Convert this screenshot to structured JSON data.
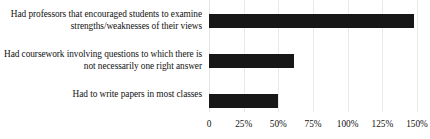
{
  "chart_data": {
    "type": "bar",
    "orientation": "horizontal",
    "title": "",
    "subtitle": "",
    "xlabel": "",
    "ylabel": "",
    "categories": [
      "Had professors that encouraged students to examine strengths/weaknesses of their views",
      "Had coursework involving questions to which there is not necessarily one right answer",
      "Had to write papers in most classes"
    ],
    "values": [
      148,
      61,
      50
    ],
    "xlim": [
      0,
      150
    ],
    "xticks": [
      0,
      25,
      50,
      75,
      100,
      125,
      150
    ],
    "xtick_labels": [
      "0",
      "25%",
      "50%",
      "75%",
      "100%",
      "125%",
      "150%"
    ],
    "grid": true,
    "legend": false,
    "bar_color": "#171717",
    "gridline_color": "#e9e9e9",
    "text_color": "#111111",
    "background_color": "#ffffff"
  },
  "axis": {
    "tick_labels": [
      "0",
      "25%",
      "50%",
      "75%",
      "100%",
      "125%",
      "150%"
    ]
  },
  "bars": [
    {
      "label": "Had professors that encouraged students to examine strengths/weaknesses of their views",
      "value": 148
    },
    {
      "label": "Had coursework involving questions to which there is not necessarily one right answer",
      "value": 61
    },
    {
      "label": "Had to write papers in most classes",
      "value": 50
    }
  ]
}
